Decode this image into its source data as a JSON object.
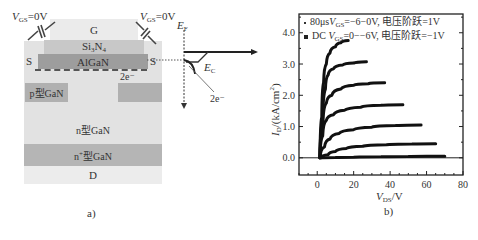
{
  "panel_a": {
    "caption": "a)",
    "vgs_left": "V",
    "vgs_left_sub": "GS",
    "vgs_left_val": "=0V",
    "vgs_right": "V",
    "vgs_right_sub": "GS",
    "vgs_right_val": "=0V",
    "layers": {
      "gate": "G",
      "si3n4_main": "Si",
      "si3n4_sub3": "3",
      "si3n4_n": "N",
      "si3n4_sub4": "4",
      "algan": "AlGaN",
      "source_left": "S",
      "source_right": "S",
      "two_deg": "2e⁻",
      "p_gan": "p型GaN",
      "n_gan": "n型GaN",
      "n_plus_gan_prefix": "n",
      "n_plus_gan_sup": "+",
      "n_plus_gan_suffix": "型GaN",
      "drain": "D"
    },
    "band": {
      "ef_main": "E",
      "ef_sub": "F",
      "ec_main": "E",
      "ec_sub": "C",
      "two_deg_label": "2e⁻"
    },
    "colors": {
      "gate": "#eaeaea",
      "si3n4": "#c8c8c8",
      "algan": "#9a9a9a",
      "substrate": "#e2e2e2",
      "p_gan": "#b0b0b0",
      "n_plus": "#b5b5b5",
      "drain": "#ececec"
    }
  },
  "panel_b": {
    "caption": "b)"
  },
  "chart_data": {
    "type": "line",
    "title": "",
    "xlabel_main": "V",
    "xlabel_sub": "DS",
    "xlabel_unit": "/V",
    "ylabel_main": "I",
    "ylabel_sub": "D",
    "ylabel_unit": "/(kA/cm",
    "ylabel_sup": "2",
    "ylabel_close": ")",
    "xlim": [
      -10,
      80
    ],
    "ylim": [
      -0.55,
      4.6
    ],
    "xticks": [
      0,
      20,
      40,
      60,
      80
    ],
    "xtick_labels": [
      "0",
      "20",
      "40",
      "60",
      "80"
    ],
    "yticks": [
      0.0,
      1.0,
      2.0,
      3.0,
      4.0
    ],
    "ytick_labels": [
      "0.0",
      "1.0",
      "2.0",
      "3.0",
      "4.0"
    ],
    "grid": false,
    "legend_position": "top",
    "legend": [
      {
        "marker": "small-dot",
        "text_prefix": "80μs",
        "var": "V",
        "var_sub": "GS",
        "text_suffix": "=−6−0V, 电压阶跃=1V"
      },
      {
        "marker": "square",
        "text_prefix": "DC ",
        "var": "V",
        "var_sub": "GS",
        "text_suffix": "=0−−6V, 电压阶跃=−1V"
      }
    ],
    "series": [
      {
        "name": "VGS step 1",
        "x": [
          1.5,
          2.5,
          3.5,
          5,
          7,
          10,
          13,
          17
        ],
        "y": [
          0,
          1.3,
          2.4,
          3.0,
          3.35,
          3.55,
          3.68,
          3.75
        ]
      },
      {
        "name": "VGS step 2",
        "x": [
          1.5,
          3,
          4.5,
          6,
          9,
          14,
          20,
          27
        ],
        "y": [
          0,
          1.2,
          2.2,
          2.65,
          2.85,
          2.97,
          3.03,
          3.07
        ]
      },
      {
        "name": "VGS step 3",
        "x": [
          1.5,
          3,
          5,
          8,
          13,
          20,
          28,
          37
        ],
        "y": [
          0,
          1.0,
          1.75,
          2.0,
          2.2,
          2.32,
          2.37,
          2.4
        ]
      },
      {
        "name": "VGS step 4",
        "x": [
          1.5,
          3,
          5,
          9,
          15,
          24,
          35,
          47
        ],
        "y": [
          0,
          0.7,
          1.2,
          1.38,
          1.52,
          1.62,
          1.68,
          1.7
        ]
      },
      {
        "name": "VGS step 5",
        "x": [
          1.5,
          4,
          7,
          12,
          20,
          30,
          43,
          57
        ],
        "y": [
          0,
          0.35,
          0.6,
          0.78,
          0.9,
          0.98,
          1.03,
          1.05
        ]
      },
      {
        "name": "VGS step 6",
        "x": [
          2,
          6,
          10,
          16,
          25,
          38,
          52,
          65
        ],
        "y": [
          0,
          0.1,
          0.2,
          0.3,
          0.37,
          0.42,
          0.44,
          0.45
        ]
      },
      {
        "name": "VGS step 7",
        "x": [
          2,
          10,
          20,
          35,
          50,
          60,
          70
        ],
        "y": [
          0,
          0.01,
          0.02,
          0.03,
          0.04,
          0.05,
          0.05
        ]
      }
    ]
  }
}
